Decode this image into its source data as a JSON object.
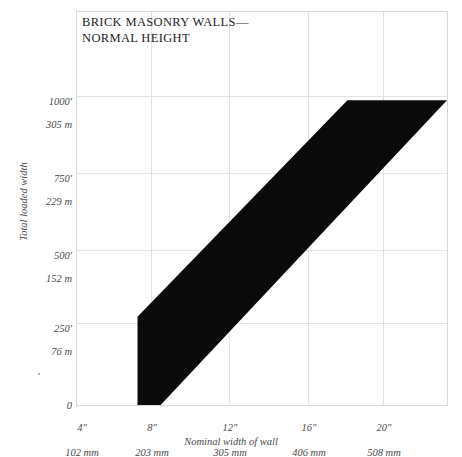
{
  "chart_data": {
    "type": "area",
    "title": "BRICK MASONRY WALLS—\nNORMAL HEIGHT",
    "xlabel": "Nominal width of wall",
    "ylabel": "Total loaded width",
    "grid": true,
    "legend": "none",
    "xlim": [
      2.6,
      23.4
    ],
    "ylim": [
      0,
      1290
    ],
    "x_unit_primary": "inches",
    "x_unit_secondary": "millimeters",
    "y_unit_primary": "feet",
    "y_unit_secondary": "meters",
    "xticks": [
      {
        "value": 4,
        "primary": "4″",
        "secondary": "102 mm"
      },
      {
        "value": 8,
        "primary": "8″",
        "secondary": "203 mm"
      },
      {
        "value": 12,
        "primary": "12″",
        "secondary": "305 mm"
      },
      {
        "value": 16,
        "primary": "16″",
        "secondary": "406 mm"
      },
      {
        "value": 20,
        "primary": "20″",
        "secondary": "508 mm"
      }
    ],
    "yticks": [
      {
        "value": 1000,
        "primary": "1000′",
        "secondary": "305 m"
      },
      {
        "value": 750,
        "primary": "750′",
        "secondary": "229 m"
      },
      {
        "value": 500,
        "primary": "500′",
        "secondary": "152 m"
      },
      {
        "value": 250,
        "primary": "250′",
        "secondary": "76 m"
      },
      {
        "value": 0,
        "primary": "0",
        "secondary": ""
      }
    ],
    "band_color": "#0a0a0a",
    "band_description": "Shaded feasible region between a lower bound and an upper bound curve, clipped at the 1000 ft (305 m) ceiling and at the right edge of the plot.",
    "band_upper_bound": [
      {
        "x": 6.0,
        "y": 290
      },
      {
        "x": 17.8,
        "y": 1000
      }
    ],
    "band_lower_bound": [
      {
        "x": 7.3,
        "y": 0
      },
      {
        "x": 23.4,
        "y": 1000
      }
    ],
    "band_polygon_xy": [
      [
        6.0,
        290
      ],
      [
        6.0,
        0
      ],
      [
        7.3,
        0
      ],
      [
        23.4,
        1000
      ],
      [
        17.8,
        1000
      ]
    ]
  },
  "figure": {
    "background_color": "#ffffff",
    "frame_color": "#d9d9d9",
    "gridline_color": "#e2e2e2",
    "text_color": "#4a4a4a",
    "title_color": "#1d1d1d"
  }
}
